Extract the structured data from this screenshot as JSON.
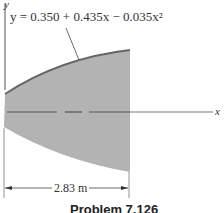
{
  "figure": {
    "equation": "y = 0.350 + 0.435x − 0.035x²",
    "y_axis_label": "y",
    "x_axis_label": "x",
    "dimension_label": "2.83 m",
    "caption": "Problem 7.126",
    "fill_color": "#b3b3b3",
    "curve_color": "#666666"
  }
}
